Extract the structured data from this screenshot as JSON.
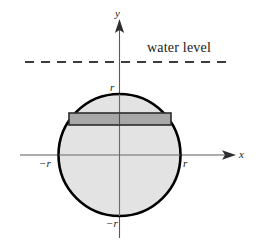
{
  "figure": {
    "labels": {
      "y_axis": "y",
      "x_axis": "x",
      "radius_top": "r",
      "radius_bottom": "−r",
      "radius_right": "r",
      "radius_left": "−r",
      "water_level": "water level"
    },
    "colors": {
      "background": "#ffffff",
      "circle_outline": "#000000",
      "circle_fill": "#e3e3e3",
      "strip_fill": "#a8a8a8",
      "strip_outline": "#2b2b2b",
      "axis": "#555555",
      "dashed_line": "#3c3c3c",
      "text": "#1a1a1a"
    },
    "geometry": {
      "circle_center_x": 119.5,
      "circle_center_y": 155,
      "circle_radius": 61,
      "water_level_y": 62,
      "water_line_x_start": 25,
      "water_line_x_end": 229,
      "strip_top_y": 113,
      "strip_bottom_y": 125,
      "strip_x_start": 69,
      "strip_x_end": 171,
      "x_axis_y": 155,
      "y_axis_x": 119.5,
      "x_axis_start": 20,
      "x_axis_end": 232,
      "y_axis_top": 22,
      "y_axis_bottom": 238
    }
  }
}
